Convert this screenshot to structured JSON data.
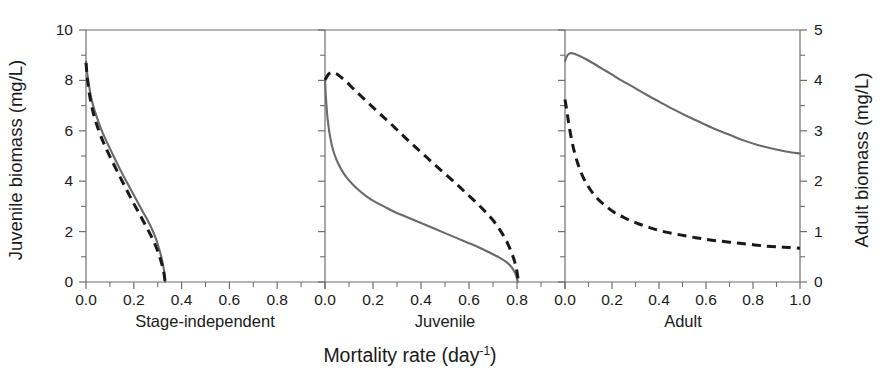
{
  "chart_data": {
    "type": "line",
    "title": "",
    "xlabel": "Mortality rate (day-1)",
    "xlabel_base": "Mortality rate (day",
    "xlabel_sup": "-1",
    "xlabel_tail": ")",
    "ylabel_left": "Juvenile biomass (mg/L)",
    "ylabel_right": "Adult biomass (mg/L)",
    "grid": false,
    "legend": "none",
    "xlim": [
      0.0,
      1.0
    ],
    "ylim_left": [
      0,
      10
    ],
    "ylim_right": [
      0,
      5
    ],
    "xticks": [
      0.0,
      0.2,
      0.4,
      0.6,
      0.8,
      1.0
    ],
    "xtick_labels": [
      "0.0",
      "0.2",
      "0.4",
      "0.6",
      "0.8",
      "1.0"
    ],
    "xminor_ticks": [
      0.1,
      0.3,
      0.5,
      0.7,
      0.9
    ],
    "yticks_left": [
      0,
      2,
      4,
      6,
      8,
      10
    ],
    "ytick_labels_left": [
      "0",
      "2",
      "4",
      "6",
      "8",
      "10"
    ],
    "yminor_ticks_left": [
      1,
      3,
      5,
      7,
      9
    ],
    "yticks_right": [
      0,
      1,
      2,
      3,
      4,
      5
    ],
    "ytick_labels_right": [
      "0",
      "1",
      "2",
      "3",
      "4",
      "5"
    ],
    "yminor_ticks_right": [
      0.5,
      1.5,
      2.5,
      3.5,
      4.5
    ],
    "panels": [
      {
        "label": "Stage-independent",
        "y_axis": "left",
        "series": [
          {
            "name": "juvenile-biomass-solid",
            "style": "solid",
            "color": "#6a6a6a",
            "x": [
              0.0,
              0.005,
              0.01,
              0.02,
              0.03,
              0.045,
              0.06,
              0.08,
              0.1,
              0.12,
              0.14,
              0.16,
              0.18,
              0.2,
              0.22,
              0.24,
              0.255,
              0.27,
              0.285,
              0.295,
              0.305,
              0.315,
              0.322,
              0.328,
              0.331
            ],
            "y": [
              8.75,
              8.3,
              7.95,
              7.4,
              7.0,
              6.55,
              6.15,
              5.7,
              5.3,
              4.9,
              4.52,
              4.15,
              3.8,
              3.45,
              3.1,
              2.75,
              2.5,
              2.22,
              1.9,
              1.65,
              1.35,
              1.0,
              0.7,
              0.35,
              0.0
            ]
          },
          {
            "name": "juvenile-biomass-dashed",
            "style": "dashed",
            "color": "#191919",
            "x": [
              0.0,
              0.005,
              0.012,
              0.022,
              0.035,
              0.05,
              0.068,
              0.085,
              0.105,
              0.125,
              0.145,
              0.165,
              0.185,
              0.205,
              0.225,
              0.245,
              0.262,
              0.278,
              0.292,
              0.303,
              0.313,
              0.321,
              0.327,
              0.331
            ],
            "y": [
              8.7,
              8.15,
              7.6,
              7.05,
              6.55,
              6.1,
              5.65,
              5.28,
              4.88,
              4.5,
              4.12,
              3.75,
              3.38,
              3.02,
              2.68,
              2.32,
              2.02,
              1.72,
              1.42,
              1.15,
              0.85,
              0.58,
              0.3,
              0.0
            ]
          }
        ]
      },
      {
        "label": "Juvenile",
        "y_axis": "left",
        "series": [
          {
            "name": "juvenile-biomass-solid",
            "style": "solid",
            "color": "#6a6a6a",
            "x": [
              0.0,
              0.004,
              0.01,
              0.018,
              0.028,
              0.04,
              0.055,
              0.072,
              0.092,
              0.115,
              0.14,
              0.17,
              0.205,
              0.245,
              0.29,
              0.34,
              0.39,
              0.44,
              0.49,
              0.54,
              0.59,
              0.64,
              0.69,
              0.725,
              0.755,
              0.775,
              0.79,
              0.798,
              0.803
            ],
            "y": [
              8.05,
              7.3,
              6.55,
              5.95,
              5.45,
              5.05,
              4.7,
              4.4,
              4.12,
              3.88,
              3.65,
              3.42,
              3.2,
              3.0,
              2.78,
              2.58,
              2.38,
              2.18,
              1.98,
              1.78,
              1.58,
              1.38,
              1.15,
              0.98,
              0.8,
              0.62,
              0.4,
              0.2,
              0.0
            ]
          },
          {
            "name": "juvenile-biomass-dashed",
            "style": "dashed",
            "color": "#191919",
            "x": [
              0.0,
              0.015,
              0.03,
              0.045,
              0.06,
              0.085,
              0.115,
              0.15,
              0.19,
              0.235,
              0.285,
              0.335,
              0.385,
              0.435,
              0.485,
              0.535,
              0.58,
              0.625,
              0.665,
              0.7,
              0.73,
              0.755,
              0.775,
              0.79,
              0.8,
              0.806
            ],
            "y": [
              8.02,
              8.25,
              8.32,
              8.28,
              8.18,
              7.98,
              7.7,
              7.38,
              7.02,
              6.62,
              6.18,
              5.72,
              5.28,
              4.85,
              4.42,
              4.0,
              3.6,
              3.2,
              2.82,
              2.45,
              2.05,
              1.65,
              1.22,
              0.82,
              0.4,
              0.0
            ]
          }
        ]
      },
      {
        "label": "Adult",
        "y_axis": "right",
        "series": [
          {
            "name": "adult-biomass-solid",
            "style": "solid",
            "color": "#6a6a6a",
            "x": [
              0.0,
              0.008,
              0.018,
              0.03,
              0.045,
              0.065,
              0.09,
              0.12,
              0.155,
              0.195,
              0.24,
              0.29,
              0.345,
              0.4,
              0.46,
              0.52,
              0.58,
              0.64,
              0.7,
              0.76,
              0.82,
              0.88,
              0.94,
              1.0
            ],
            "y": [
              4.38,
              4.48,
              4.53,
              4.54,
              4.52,
              4.48,
              4.42,
              4.34,
              4.24,
              4.13,
              4.0,
              3.87,
              3.72,
              3.58,
              3.43,
              3.29,
              3.16,
              3.03,
              2.92,
              2.81,
              2.72,
              2.65,
              2.59,
              2.55
            ]
          },
          {
            "name": "adult-biomass-dashed",
            "style": "dashed",
            "color": "#191919",
            "x": [
              0.0,
              0.006,
              0.014,
              0.025,
              0.04,
              0.058,
              0.08,
              0.105,
              0.135,
              0.17,
              0.21,
              0.255,
              0.305,
              0.36,
              0.42,
              0.485,
              0.555,
              0.625,
              0.7,
              0.78,
              0.86,
              0.93,
              1.0
            ],
            "y": [
              3.62,
              3.45,
              3.2,
              2.9,
              2.58,
              2.3,
              2.05,
              1.85,
              1.67,
              1.52,
              1.38,
              1.27,
              1.17,
              1.08,
              1.0,
              0.94,
              0.88,
              0.83,
              0.79,
              0.75,
              0.71,
              0.69,
              0.67
            ]
          }
        ]
      }
    ]
  },
  "axes": {
    "left_title": "Juvenile biomass (mg/L)",
    "right_title": "Adult biomass (mg/L)",
    "x_title_base": "Mortality rate (day",
    "x_title_sup": "-1",
    "x_title_tail": ")"
  },
  "panel_labels": {
    "p0": "Stage-independent",
    "p1": "Juvenile",
    "p2": "Adult"
  },
  "xtick_labels": {
    "t0": "0.0",
    "t1": "0.2",
    "t2": "0.4",
    "t3": "0.6",
    "t4": "0.8",
    "t5": "1.0"
  },
  "ytick_labels_left": {
    "t0": "0",
    "t1": "2",
    "t2": "4",
    "t3": "6",
    "t4": "8",
    "t5": "10"
  },
  "ytick_labels_right": {
    "t0": "0",
    "t1": "1",
    "t2": "2",
    "t3": "3",
    "t4": "4",
    "t5": "5"
  }
}
